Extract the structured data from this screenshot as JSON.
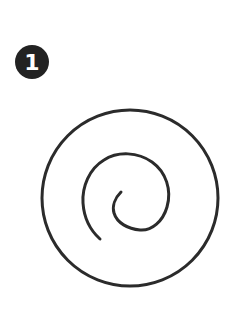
{
  "step": {
    "number": "1",
    "badge_color": "#222222",
    "text_color": "#ffffff"
  },
  "figure": {
    "stroke_color": "#2b2b2b",
    "circle": {
      "cx": 130,
      "cy": 198,
      "r": 89
    }
  }
}
